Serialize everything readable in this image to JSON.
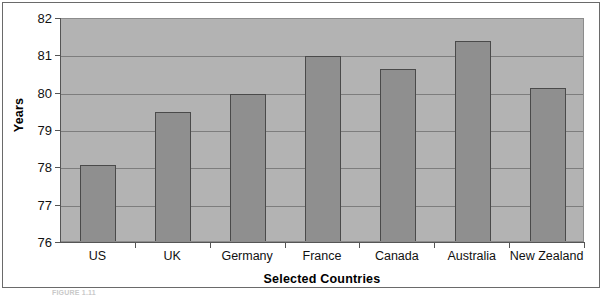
{
  "chart_data": {
    "type": "bar",
    "title": "",
    "xlabel": "Selected Countries",
    "ylabel": "Years",
    "categories": [
      "US",
      "UK",
      "Germany",
      "France",
      "Canada",
      "Australia",
      "New Zealand"
    ],
    "values": [
      78.1,
      79.5,
      80.0,
      81.0,
      80.67,
      81.4,
      80.15
    ],
    "ylim": [
      76,
      82
    ],
    "yticks": [
      76,
      77,
      78,
      79,
      80,
      81,
      82
    ],
    "ytick_labels": [
      "76",
      "77",
      "78",
      "79",
      "80",
      "81",
      "82"
    ],
    "grid": true,
    "legend": false,
    "colors": {
      "bar_fill": "#8f8f8f",
      "bar_stroke": "#4a4a4a",
      "plot_background": "#b3b3b3",
      "gridline": "#7d7d7d",
      "axis": "#555555",
      "text": "#111111"
    }
  },
  "figure": {
    "caption": "FIGURE 1.11"
  }
}
